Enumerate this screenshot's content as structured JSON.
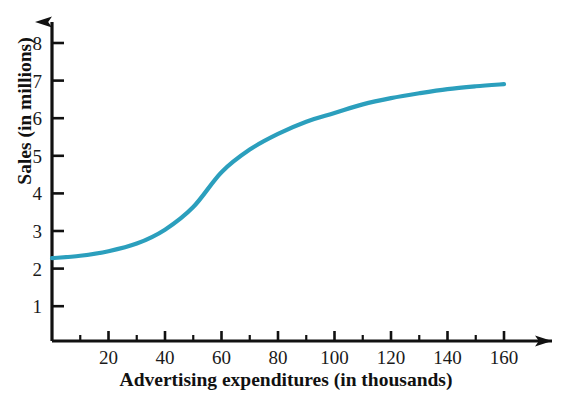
{
  "chart_data": {
    "type": "line",
    "title": "",
    "xlabel": "Advertising expenditures (in thousands)",
    "ylabel": "Sales (in millions)",
    "xlim": [
      0,
      175
    ],
    "ylim": [
      0,
      8.6
    ],
    "grid": false,
    "legend": null,
    "series": [
      {
        "name": "Sales",
        "color": "#2b9fbd",
        "x": [
          0,
          10,
          20,
          30,
          40,
          50,
          60,
          70,
          80,
          90,
          100,
          110,
          120,
          130,
          140,
          150,
          160
        ],
        "values": [
          2.38,
          2.45,
          2.58,
          2.8,
          3.2,
          3.85,
          4.85,
          5.5,
          5.95,
          6.3,
          6.55,
          6.8,
          6.98,
          7.12,
          7.24,
          7.32,
          7.38
        ]
      }
    ],
    "x_major_ticks": [
      20,
      40,
      60,
      80,
      100,
      120,
      140,
      160
    ],
    "x_minor_ticks": [
      10,
      30,
      50,
      70,
      90,
      110,
      130,
      150
    ],
    "x_tick_labels": [
      "20",
      "40",
      "60",
      "80",
      "100",
      "120",
      "140",
      "160"
    ],
    "y_major_ticks": [
      1,
      2,
      3,
      4,
      5,
      6,
      7,
      8
    ],
    "y_tick_labels": [
      "1",
      "2",
      "3",
      "4",
      "5",
      "6",
      "7",
      "8"
    ],
    "axis_color": "#111111",
    "axis_style": "arrow-tipped"
  }
}
